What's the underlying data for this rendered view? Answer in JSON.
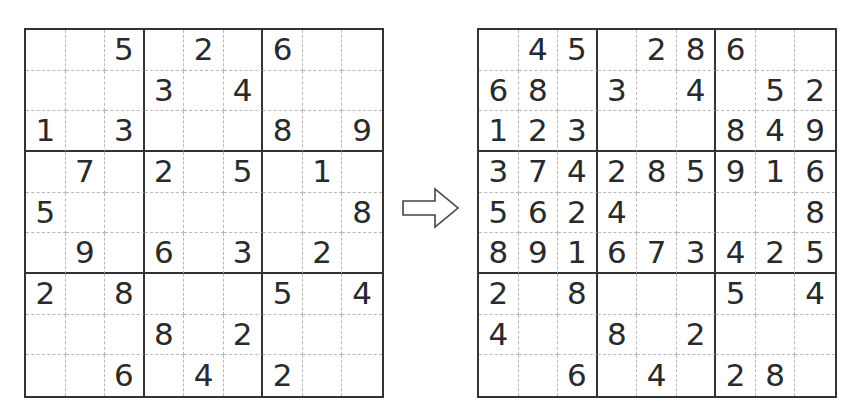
{
  "puzzle": {
    "label": "Sudoku puzzle (initial)",
    "rows": [
      [
        "",
        "",
        "5",
        "",
        "2",
        "",
        "6",
        "",
        ""
      ],
      [
        "",
        "",
        "",
        "3",
        "",
        "4",
        "",
        "",
        ""
      ],
      [
        "1",
        "",
        "3",
        "",
        "",
        "",
        "8",
        "",
        "9"
      ],
      [
        "",
        "7",
        "",
        "2",
        "",
        "5",
        "",
        "1",
        ""
      ],
      [
        "5",
        "",
        "",
        "",
        "",
        "",
        "",
        "",
        "8"
      ],
      [
        "",
        "9",
        "",
        "6",
        "",
        "3",
        "",
        "2",
        ""
      ],
      [
        "2",
        "",
        "8",
        "",
        "",
        "",
        "5",
        "",
        "4"
      ],
      [
        "",
        "",
        "",
        "8",
        "",
        "2",
        "",
        "",
        ""
      ],
      [
        "",
        "",
        "6",
        "",
        "4",
        "",
        "2",
        "",
        ""
      ]
    ]
  },
  "arrow": {
    "icon": "right-arrow-icon",
    "meaning": "transforms into"
  },
  "progress": {
    "label": "Sudoku puzzle (partially solved)",
    "rows": [
      [
        "",
        "4",
        "5",
        "",
        "2",
        "8",
        "6",
        "",
        ""
      ],
      [
        "6",
        "8",
        "",
        "3",
        "",
        "4",
        "",
        "5",
        "2"
      ],
      [
        "1",
        "2",
        "3",
        "",
        "",
        "",
        "8",
        "4",
        "9"
      ],
      [
        "3",
        "7",
        "4",
        "2",
        "8",
        "5",
        "9",
        "1",
        "6"
      ],
      [
        "5",
        "6",
        "2",
        "4",
        "",
        "",
        "",
        "",
        "8"
      ],
      [
        "8",
        "9",
        "1",
        "6",
        "7",
        "3",
        "4",
        "2",
        "5"
      ],
      [
        "2",
        "",
        "8",
        "",
        "",
        "",
        "5",
        "",
        "4"
      ],
      [
        "4",
        "",
        "",
        "8",
        "",
        "2",
        "",
        "",
        ""
      ],
      [
        "",
        "",
        "6",
        "",
        "4",
        "",
        "2",
        "8",
        ""
      ]
    ]
  },
  "colors": {
    "grid_line": "#333333",
    "minor_line": "#b8b8b8",
    "digit": "#2a2a2a",
    "background": "#ffffff"
  }
}
